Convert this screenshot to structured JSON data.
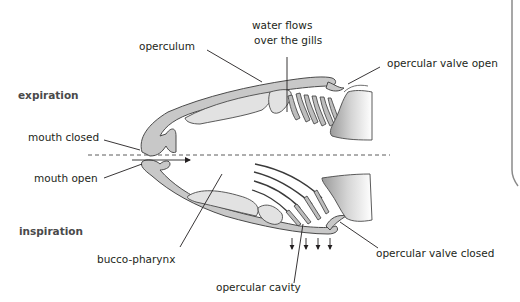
{
  "diagram": {
    "sections": {
      "top": "expiration",
      "bottom": "inspiration"
    },
    "labels": {
      "operculum": "operculum",
      "water_flows_line1": "water flows",
      "water_flows_line2": "over the gills",
      "opercular_valve_open": "opercular valve open",
      "mouth_closed": "mouth closed",
      "mouth_open": "mouth open",
      "bucco_pharynx": "bucco-pharynx",
      "opercular_valve_closed": "opercular valve closed",
      "opercular_cavity": "opercular cavity"
    },
    "colors": {
      "tissue_dark": "#c8c8c8",
      "tissue_light": "#e2e2e2",
      "outline": "#4a4a4a",
      "text": "#231f20"
    }
  }
}
